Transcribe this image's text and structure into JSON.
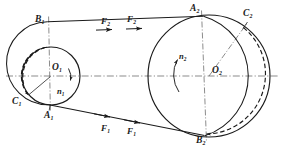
{
  "figure": {
    "type": "belt-drive-schematic",
    "background_color": "#ffffff",
    "line_color": "#1a1a1a",
    "centerline_color": "#555555"
  },
  "pulleys": [
    {
      "id": "small",
      "center_label": "O",
      "center_sub": "1",
      "cx": 51,
      "cy": 76,
      "r": 29,
      "speed_label": "n",
      "speed_sub": "1",
      "rotation": "clockwise"
    },
    {
      "id": "large",
      "center_label": "O",
      "center_sub": "2",
      "cx": 209,
      "cy": 76,
      "r": 61,
      "speed_label": "n",
      "speed_sub": "2",
      "rotation": "clockwise"
    }
  ],
  "points": [
    {
      "name": "B1",
      "base": "B",
      "sub": "1",
      "x": 47.5,
      "y": 22.0,
      "label_x": 35,
      "label_y": 16
    },
    {
      "name": "C1",
      "base": "C",
      "sub": "1",
      "x": 28.0,
      "y": 96.0,
      "label_x": 14,
      "label_y": 100
    },
    {
      "name": "A1",
      "base": "A",
      "sub": "1",
      "x": 48.5,
      "y": 105.0,
      "label_x": 44,
      "label_y": 113
    },
    {
      "name": "A2",
      "base": "A",
      "sub": "2",
      "x": 203.0,
      "y": 16.0,
      "label_x": 191,
      "label_y": 6
    },
    {
      "name": "C2",
      "base": "C",
      "sub": "2",
      "x": 244.0,
      "y": 27.0,
      "label_x": 245,
      "label_y": 12
    },
    {
      "name": "B2",
      "base": "B",
      "sub": "2",
      "x": 205.0,
      "y": 136.0,
      "label_x": 197,
      "label_y": 137
    }
  ],
  "forces": [
    {
      "label": "F",
      "sub": "2",
      "side": "upper",
      "label_x": 103,
      "label_y": 19,
      "direction": "right"
    },
    {
      "label": "F",
      "sub": "2",
      "side": "upper",
      "label_x": 128,
      "label_y": 16,
      "direction": "right"
    },
    {
      "label": "F",
      "sub": "1",
      "side": "lower",
      "label_x": 102,
      "label_y": 127,
      "direction": "right"
    },
    {
      "label": "F",
      "sub": "1",
      "side": "lower",
      "label_x": 128,
      "label_y": 130,
      "direction": "right"
    }
  ],
  "speed_labels": [
    {
      "label": "n",
      "sub": "1",
      "label_x": 57,
      "label_y": 88
    },
    {
      "label": "n",
      "sub": "2",
      "label_x": 180,
      "label_y": 54
    }
  ],
  "center_labels": [
    {
      "label": "O",
      "sub": "1",
      "label_x": 52,
      "label_y": 64
    },
    {
      "label": "O",
      "sub": "2",
      "label_x": 213,
      "label_y": 68
    }
  ],
  "annotations": {
    "upper_belt": "tight side, force F2, moving right",
    "lower_belt": "slack side, force F1, moving right",
    "dashed_arcs": "belt slip / wrap arcs shown dashed on both pulleys"
  }
}
